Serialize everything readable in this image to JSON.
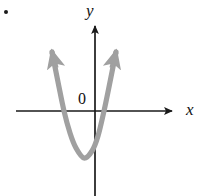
{
  "figure": {
    "width": 199,
    "height": 196,
    "background_color": "#ffffff",
    "bullet_marker": "bullet-dot",
    "axis_color": "#1a1a1a",
    "curve_color": "#a0a0a0",
    "curve_width": 5,
    "labels": {
      "y_axis": "y",
      "x_axis": "x",
      "origin": "0"
    }
  },
  "chart_data": {
    "type": "line",
    "title": "",
    "subtitle": "",
    "xlabel": "x",
    "ylabel": "y",
    "origin_label": "0",
    "grid": false,
    "legend": null,
    "annotations": [],
    "axes": {
      "x_axis_pixel_y": 111,
      "y_axis_pixel_x": 95,
      "x_axis_from_pixel_x": 16,
      "x_axis_to_pixel_x": 178,
      "y_axis_from_pixel_y": 20,
      "y_axis_to_pixel_y": 196,
      "x_arrow": "right",
      "y_arrow": "up"
    },
    "series": [
      {
        "name": "parabola",
        "shape": "upward-opening parabola",
        "color": "#a0a0a0",
        "arrowheads": [
          "upper-left-end",
          "upper-right-end"
        ],
        "vertex": {
          "x_px": 84,
          "y_px": 158
        },
        "x_intercepts_px": [
          64,
          104
        ],
        "y_intercept_px": 148,
        "endpoints_px": [
          {
            "x_px": 52,
            "y_px": 52
          },
          {
            "x_px": 116,
            "y_px": 52
          }
        ],
        "points_px": [
          {
            "x_px": 52,
            "y_px": 52
          },
          {
            "x_px": 58,
            "y_px": 82
          },
          {
            "x_px": 64,
            "y_px": 111
          },
          {
            "x_px": 70,
            "y_px": 133
          },
          {
            "x_px": 76,
            "y_px": 148
          },
          {
            "x_px": 84,
            "y_px": 158
          },
          {
            "x_px": 92,
            "y_px": 151
          },
          {
            "x_px": 98,
            "y_px": 136
          },
          {
            "x_px": 104,
            "y_px": 111
          },
          {
            "x_px": 110,
            "y_px": 82
          },
          {
            "x_px": 116,
            "y_px": 52
          }
        ]
      }
    ]
  }
}
